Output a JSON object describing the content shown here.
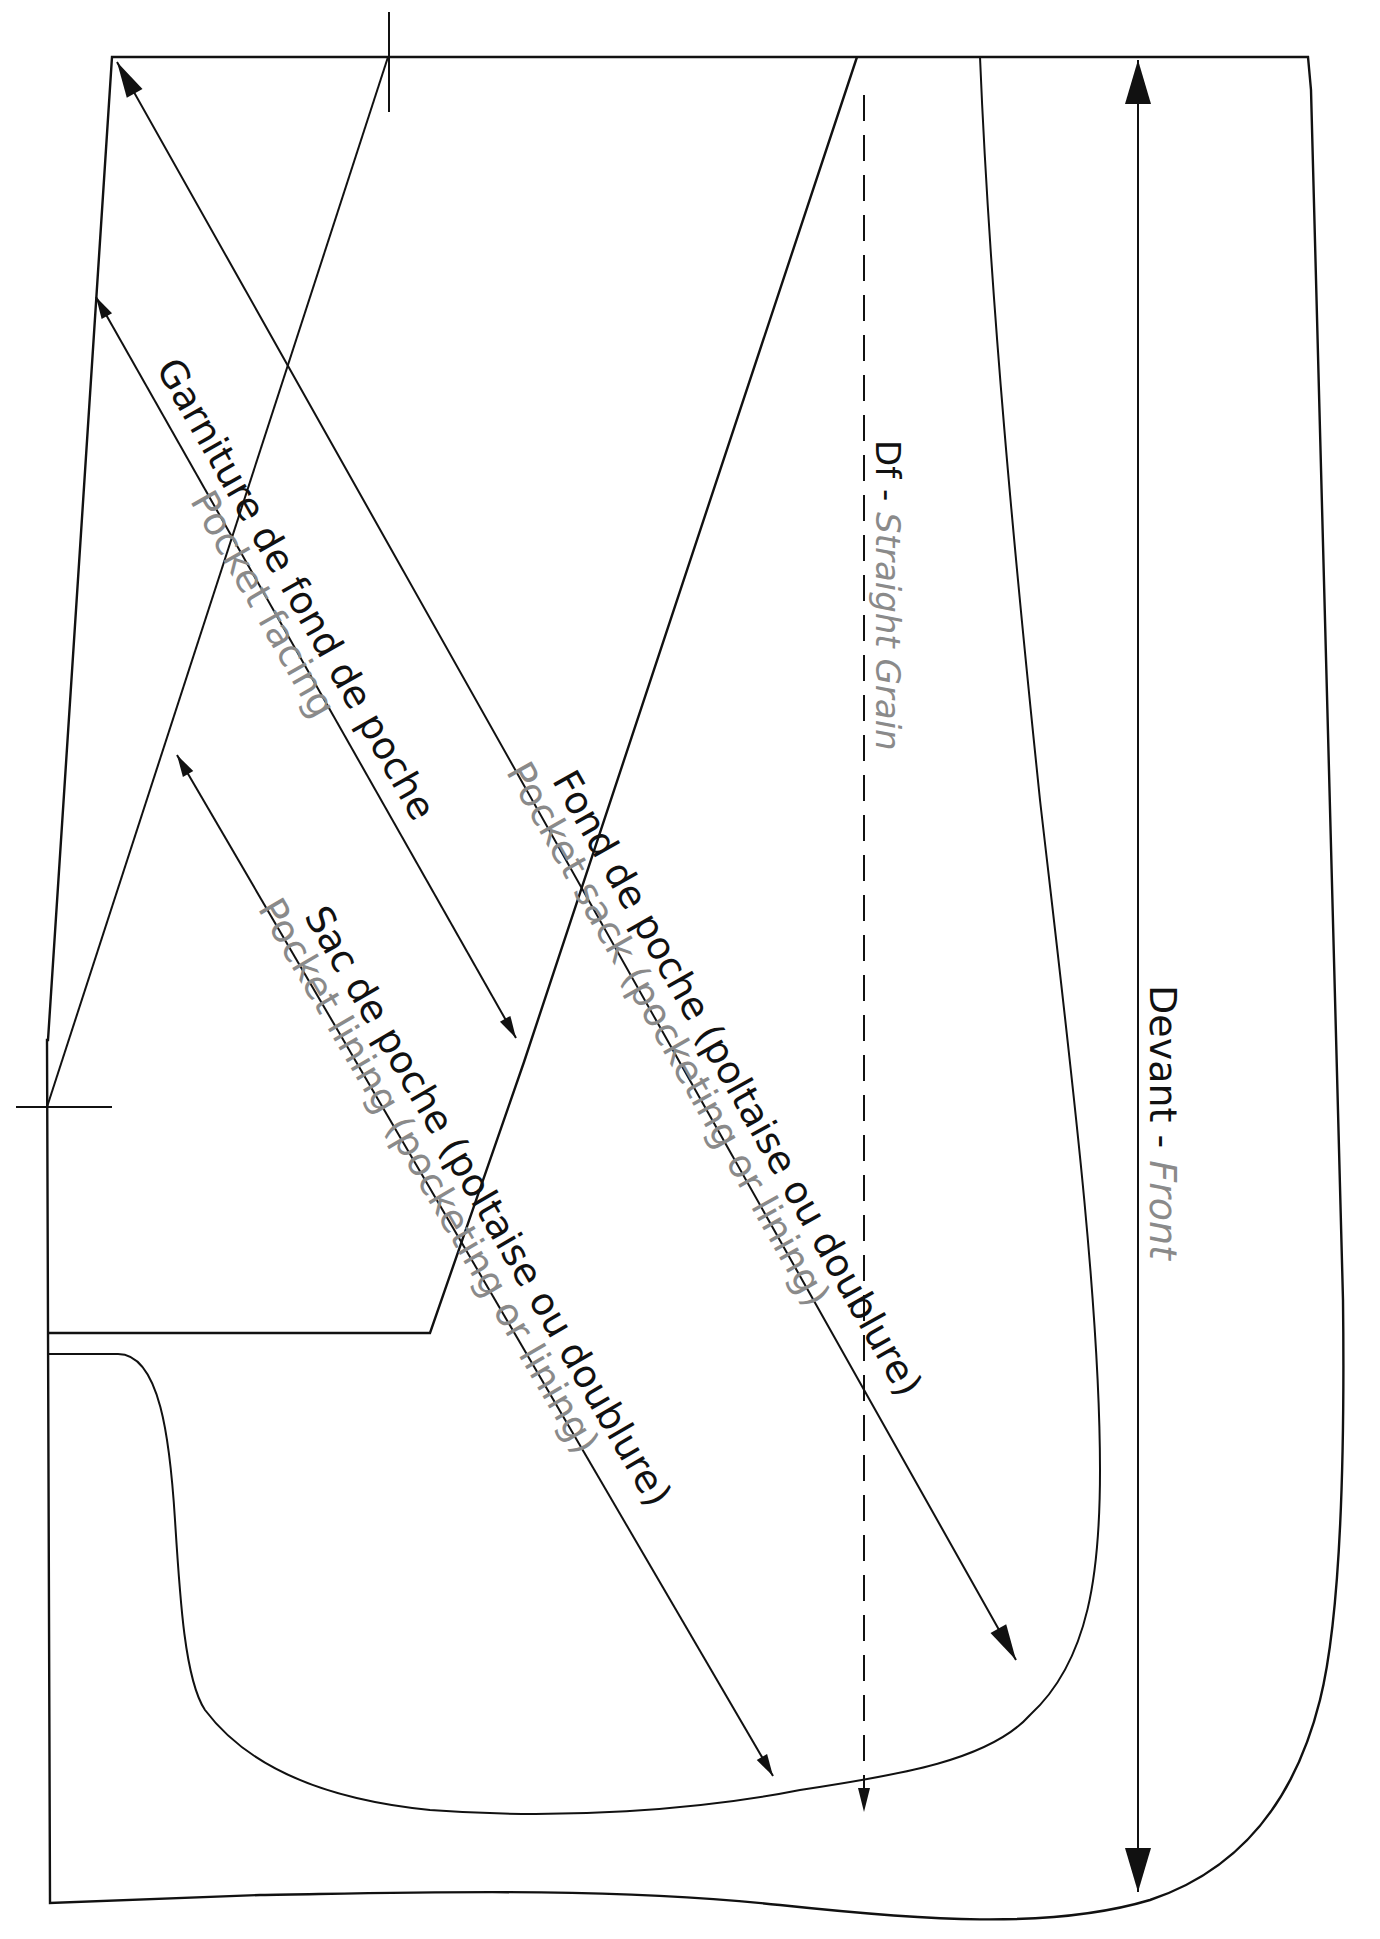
{
  "diagram": {
    "type": "sewing-pattern",
    "piece_name_fr": "Devant",
    "piece_name_en": "Front",
    "colors": {
      "line": "#111111",
      "french_text": "#111111",
      "english_text": "#8a8a8a",
      "background": "#ffffff"
    }
  },
  "labels": {
    "front": {
      "fr": "Devant - ",
      "en": "Front"
    },
    "grain": {
      "fr": "Df - ",
      "en": "Straight Grain"
    },
    "pocket_facing": {
      "fr": "Garniture de fond de poche",
      "en": "Pocket facing"
    },
    "pocket_sack": {
      "fr": "Fond de poche (poltaise ou doublure)",
      "en": "Pocket sack (pocketing or lining)"
    },
    "pocket_lining": {
      "fr": "Sac de poche (poltaise ou doublure)",
      "en": "Pocket lining (pocketing or lining)"
    }
  },
  "geometry": {
    "outer_outline": "M 112 57 L 1308 57 L 1311 90 L 1343 1300 C 1345 1470 1340 1620 1320 1700 C 1295 1800 1240 1870 1150 1900 C 1050 1930 920 1920 780 1905 C 600 1886 400 1893 260 1895 L 50 1903 L 47 1040 L 48 1040 L 112 57 Z",
    "inner_outline_points": [
      [
        47,
        1333
      ],
      [
        430,
        1333
      ],
      [
        524,
        1062
      ],
      [
        857,
        57
      ]
    ],
    "pocket_sack_outline": "M 47 1354 L 118 1354 C 160 1354 170 1440 175 1520 C 180 1600 185 1680 205 1710 C 250 1770 330 1800 430 1810 C 560 1820 700 1810 800 1790 C 900 1775 990 1760 1030 1715 C 1090 1660 1100 1570 1100 1470 C 1100 1300 1070 1060 1040 800 C 1015 560 990 300 980 57",
    "facing_line": [
      [
        47,
        1107
      ],
      [
        388,
        57
      ]
    ],
    "notch_top": [
      [
        389,
        12
      ],
      [
        389,
        112
      ]
    ],
    "notch_left": [
      [
        16,
        1107
      ],
      [
        112,
        1107
      ]
    ],
    "front_arrow": [
      [
        1138,
        60
      ],
      [
        1138,
        1892
      ]
    ],
    "grain_arrow": [
      [
        864,
        95
      ],
      [
        864,
        1812
      ]
    ],
    "sack_arrow": [
      [
        117,
        62
      ],
      [
        1016,
        1660
      ]
    ],
    "facing_arrow": [
      [
        96,
        297
      ],
      [
        516,
        1038
      ]
    ],
    "lining_arrow": [
      [
        177,
        755
      ],
      [
        773,
        1776
      ]
    ]
  }
}
